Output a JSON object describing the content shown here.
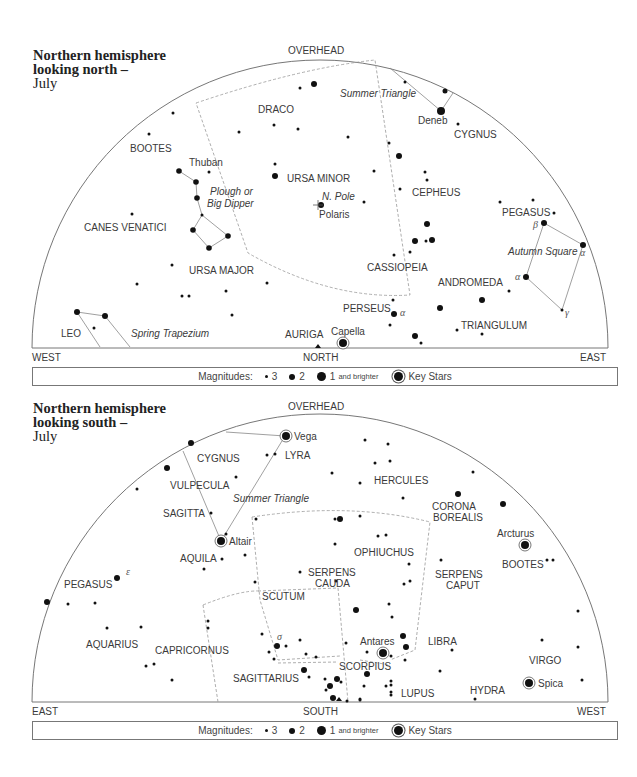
{
  "north": {
    "title_line1": "Northern hemisphere",
    "title_line2": "looking north –",
    "title_line3": "July",
    "overhead": "OVERHEAD",
    "left_dir": "WEST",
    "center_dir": "NORTH",
    "right_dir": "EAST",
    "constellations": [
      "DRACO",
      "BOOTES",
      "URSA MINOR",
      "CANES VENATICI",
      "URSA MAJOR",
      "CEPHEUS",
      "CYGNUS",
      "PEGASUS",
      "CASSIOPEIA",
      "ANDROMEDA",
      "PERSEUS",
      "TRIANGULUM",
      "LEO",
      "AURIGA"
    ],
    "asterisms": [
      "Summer Triangle",
      "Plough or Big Dipper",
      "Autumn Square",
      "Spring Trapezium"
    ],
    "stars_named": [
      "Deneb",
      "Thuban",
      "Polaris",
      "Capella"
    ],
    "markers": [
      "N. Pole"
    ],
    "greek": [
      "β",
      "α",
      "α",
      "α",
      "γ"
    ]
  },
  "south": {
    "title_line1": "Northern hemisphere",
    "title_line2": "looking south –",
    "title_line3": "July",
    "overhead": "OVERHEAD",
    "left_dir": "EAST",
    "center_dir": "SOUTH",
    "right_dir": "WEST",
    "constellations": [
      "CYGNUS",
      "LYRA",
      "VULPECULA",
      "SAGITTA",
      "HERCULES",
      "CORONA BOREALIS",
      "AQUILA",
      "OPHIUCHUS",
      "SERPENS CAUDA",
      "SERPENS CAPUT",
      "BOOTES",
      "PEGASUS",
      "SCUTUM",
      "AQUARIUS",
      "CAPRICORNUS",
      "LIBRA",
      "VIRGO",
      "SCORPIUS",
      "SAGITTARIUS",
      "LUPUS",
      "HYDRA"
    ],
    "asterisms": [
      "Summer Triangle"
    ],
    "stars_named": [
      "Vega",
      "Altair",
      "Arcturus",
      "Antares",
      "Spica"
    ],
    "greek": [
      "ε",
      "σ"
    ]
  },
  "legend": {
    "label": "Magnitudes:",
    "mag3": "3",
    "mag2": "2",
    "mag1": "1",
    "mag1_suffix": "and brighter",
    "key": "Key Stars"
  }
}
